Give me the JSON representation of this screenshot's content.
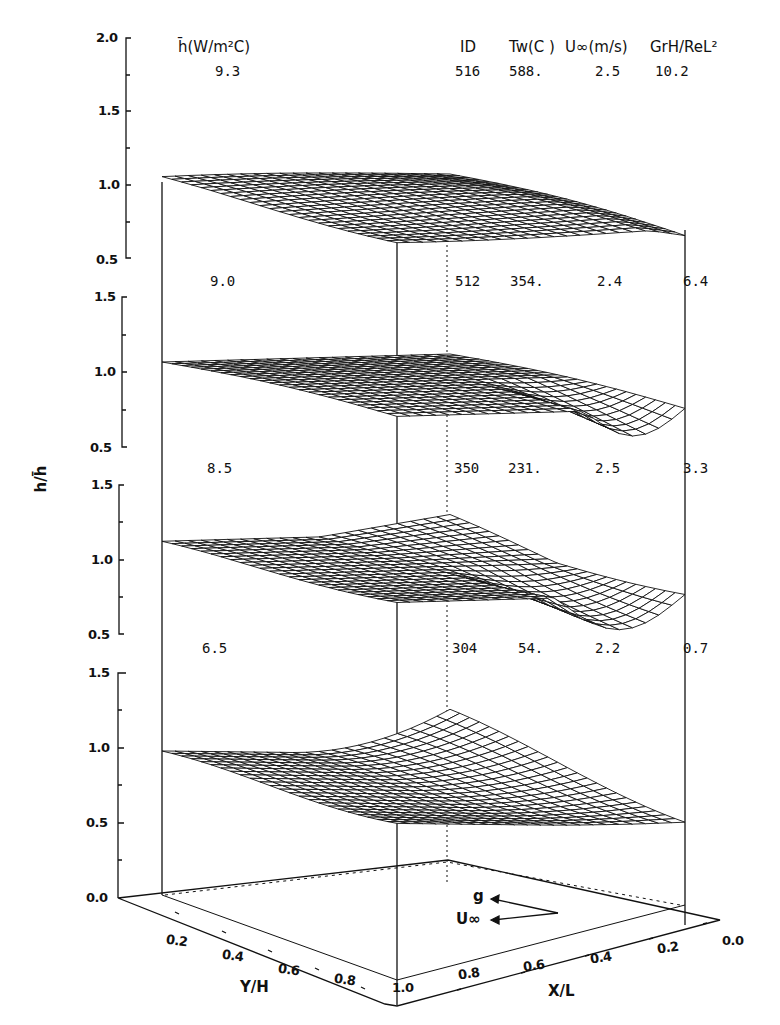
{
  "header": {
    "hbar_label": "h̄(W/m²C)",
    "columns": [
      "ID",
      "Tw(C )",
      "U∞(m/s)",
      "GrH/ReL²"
    ]
  },
  "panels": [
    {
      "hbar": "9.3",
      "id": "516",
      "tw": "588.",
      "uinf": "2.5",
      "gr_re": "10.2",
      "y_ticks": [
        "2.0",
        "1.5",
        "1.0",
        "0.5"
      ]
    },
    {
      "hbar": "9.0",
      "id": "512",
      "tw": "354.",
      "uinf": "2.4",
      "gr_re": "6.4",
      "y_ticks": [
        "1.5",
        "1.0",
        "0.5"
      ]
    },
    {
      "hbar": "8.5",
      "id": "350",
      "tw": "231.",
      "uinf": "2.5",
      "gr_re": "3.3",
      "y_ticks": [
        "1.5",
        "1.0",
        "0.5"
      ]
    },
    {
      "hbar": "6.5",
      "id": "304",
      "tw": "54.",
      "uinf": "2.2",
      "gr_re": "0.7",
      "y_ticks": [
        "1.5",
        "1.0",
        "0.5",
        "0.0"
      ]
    }
  ],
  "axes": {
    "z_label": "h/h̄",
    "y_label": "Y/H",
    "x_label": "X/L",
    "y_ticks": [
      "0.2",
      "0.4",
      "0.6",
      "0.8",
      "1.0"
    ],
    "x_ticks": [
      "1.0",
      "0.8",
      "0.6",
      "0.4",
      "0.2",
      "0.0"
    ]
  },
  "legend": {
    "g_label": "g",
    "u_label": "U∞"
  },
  "chart_data": {
    "type": "surface",
    "title": "",
    "xlabel": "X/L",
    "ylabel": "Y/H",
    "zlabel": "h/h̄",
    "x_range": [
      0.0,
      1.0
    ],
    "y_range": [
      0.0,
      1.0
    ],
    "series": [
      {
        "name": "ID 516",
        "hbar_W_m2C": 9.3,
        "Tw_C": 588,
        "U_inf_m_s": 2.5,
        "GrH_ReL2": 10.2,
        "z_range": [
          0.5,
          2.0
        ],
        "z_approx_range": [
          0.8,
          1.2
        ]
      },
      {
        "name": "ID 512",
        "hbar_W_m2C": 9.0,
        "Tw_C": 354,
        "U_inf_m_s": 2.4,
        "GrH_ReL2": 6.4,
        "z_range": [
          0.5,
          1.5
        ],
        "z_approx_range": [
          0.6,
          1.2
        ]
      },
      {
        "name": "ID 350",
        "hbar_W_m2C": 8.5,
        "Tw_C": 231,
        "U_inf_m_s": 2.5,
        "GrH_ReL2": 3.3,
        "z_range": [
          0.5,
          1.5
        ],
        "z_approx_range": [
          0.55,
          1.3
        ]
      },
      {
        "name": "ID 304",
        "hbar_W_m2C": 6.5,
        "Tw_C": 54,
        "U_inf_m_s": 2.2,
        "GrH_ReL2": 0.7,
        "z_range": [
          0.0,
          1.5
        ],
        "z_approx_range": [
          0.6,
          1.45
        ]
      }
    ]
  }
}
